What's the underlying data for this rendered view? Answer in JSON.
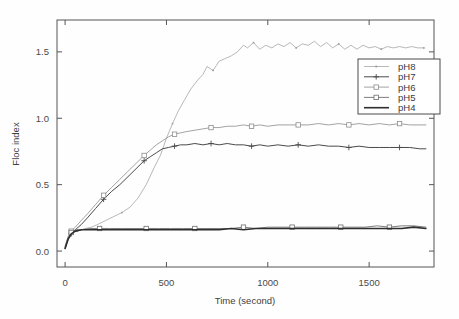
{
  "chart_data": {
    "type": "line",
    "title": "",
    "xlabel": "Time (second)",
    "ylabel": "Floc index",
    "xlim": [
      -40,
      1820
    ],
    "ylim": [
      -0.12,
      1.74
    ],
    "xticks": [
      0,
      500,
      1000,
      1500
    ],
    "xtick_labels": [
      "0",
      "500",
      "1000",
      "1500"
    ],
    "yticks": [
      0.0,
      0.5,
      1.0,
      1.5
    ],
    "ytick_labels": [
      "0.0",
      "0.5",
      "1.0",
      "1.5"
    ],
    "grid": false,
    "legend_position": "upper right",
    "series": [
      {
        "name": "pH8",
        "color": "#9a9a9a",
        "width": 0.7,
        "marker": "dot",
        "x": [
          0,
          20,
          40,
          60,
          80,
          100,
          130,
          160,
          200,
          240,
          280,
          320,
          360,
          400,
          440,
          470,
          500,
          530,
          560,
          590,
          620,
          650,
          680,
          700,
          730,
          760,
          790,
          820,
          850,
          880,
          900,
          930,
          960,
          990,
          1020,
          1050,
          1080,
          1110,
          1140,
          1170,
          1200,
          1230,
          1260,
          1290,
          1320,
          1350,
          1380,
          1410,
          1440,
          1470,
          1500,
          1530,
          1560,
          1590,
          1620,
          1650,
          1680,
          1710,
          1740,
          1770
        ],
        "y": [
          0.03,
          0.1,
          0.14,
          0.15,
          0.16,
          0.17,
          0.18,
          0.2,
          0.23,
          0.26,
          0.29,
          0.33,
          0.4,
          0.5,
          0.63,
          0.72,
          0.85,
          0.96,
          1.06,
          1.14,
          1.22,
          1.28,
          1.33,
          1.39,
          1.36,
          1.43,
          1.45,
          1.47,
          1.5,
          1.55,
          1.53,
          1.57,
          1.52,
          1.55,
          1.53,
          1.56,
          1.54,
          1.57,
          1.53,
          1.56,
          1.55,
          1.58,
          1.54,
          1.57,
          1.53,
          1.56,
          1.52,
          1.55,
          1.52,
          1.55,
          1.53,
          1.54,
          1.52,
          1.54,
          1.53,
          1.54,
          1.53,
          1.54,
          1.53,
          1.53
        ]
      },
      {
        "name": "pH7",
        "color": "#4a4a4a",
        "width": 1.0,
        "marker": "plus",
        "x": [
          0,
          15,
          30,
          50,
          80,
          110,
          150,
          190,
          230,
          270,
          310,
          350,
          390,
          420,
          450,
          480,
          510,
          540,
          570,
          600,
          640,
          680,
          720,
          760,
          800,
          840,
          880,
          920,
          960,
          1000,
          1050,
          1100,
          1150,
          1200,
          1250,
          1300,
          1350,
          1400,
          1450,
          1500,
          1550,
          1600,
          1650,
          1700,
          1750,
          1780
        ],
        "y": [
          0.02,
          0.09,
          0.13,
          0.16,
          0.2,
          0.25,
          0.32,
          0.39,
          0.45,
          0.5,
          0.56,
          0.62,
          0.68,
          0.71,
          0.74,
          0.77,
          0.78,
          0.79,
          0.8,
          0.8,
          0.81,
          0.8,
          0.81,
          0.8,
          0.81,
          0.8,
          0.8,
          0.79,
          0.8,
          0.79,
          0.8,
          0.79,
          0.8,
          0.79,
          0.8,
          0.79,
          0.79,
          0.78,
          0.79,
          0.78,
          0.78,
          0.78,
          0.78,
          0.78,
          0.77,
          0.77
        ]
      },
      {
        "name": "pH6",
        "color": "#8c8c8c",
        "width": 0.8,
        "marker": "square",
        "x": [
          0,
          15,
          30,
          50,
          80,
          110,
          150,
          190,
          230,
          270,
          310,
          350,
          390,
          420,
          450,
          480,
          510,
          540,
          570,
          600,
          640,
          680,
          720,
          760,
          800,
          840,
          880,
          920,
          960,
          1000,
          1050,
          1100,
          1150,
          1200,
          1250,
          1300,
          1350,
          1400,
          1450,
          1500,
          1550,
          1600,
          1650,
          1700,
          1750,
          1780
        ],
        "y": [
          0.04,
          0.11,
          0.15,
          0.18,
          0.23,
          0.28,
          0.35,
          0.42,
          0.48,
          0.54,
          0.6,
          0.66,
          0.72,
          0.76,
          0.8,
          0.83,
          0.86,
          0.88,
          0.89,
          0.9,
          0.91,
          0.92,
          0.93,
          0.93,
          0.94,
          0.94,
          0.95,
          0.94,
          0.95,
          0.94,
          0.95,
          0.95,
          0.95,
          0.95,
          0.96,
          0.95,
          0.96,
          0.95,
          0.96,
          0.95,
          0.96,
          0.95,
          0.96,
          0.95,
          0.95,
          0.95
        ]
      },
      {
        "name": "pH5",
        "color": "#6e6e6e",
        "width": 0.9,
        "marker": "square",
        "x": [
          0,
          15,
          30,
          50,
          80,
          120,
          170,
          220,
          280,
          340,
          400,
          460,
          520,
          580,
          640,
          700,
          760,
          820,
          880,
          940,
          1000,
          1060,
          1120,
          1180,
          1240,
          1300,
          1360,
          1420,
          1480,
          1540,
          1600,
          1660,
          1720,
          1780
        ],
        "y": [
          0.03,
          0.1,
          0.14,
          0.16,
          0.16,
          0.17,
          0.17,
          0.17,
          0.17,
          0.17,
          0.17,
          0.17,
          0.17,
          0.17,
          0.17,
          0.17,
          0.17,
          0.17,
          0.18,
          0.17,
          0.18,
          0.18,
          0.18,
          0.18,
          0.18,
          0.18,
          0.18,
          0.18,
          0.18,
          0.19,
          0.18,
          0.19,
          0.19,
          0.18
        ]
      },
      {
        "name": "pH4",
        "color": "#2e2e2e",
        "width": 1.6,
        "marker": "none",
        "x": [
          0,
          15,
          30,
          50,
          80,
          120,
          170,
          220,
          280,
          340,
          400,
          460,
          520,
          580,
          640,
          700,
          760,
          820,
          880,
          940,
          1000,
          1060,
          1120,
          1180,
          1240,
          1300,
          1360,
          1420,
          1480,
          1540,
          1600,
          1660,
          1720,
          1780
        ],
        "y": [
          0.02,
          0.09,
          0.13,
          0.15,
          0.16,
          0.16,
          0.16,
          0.16,
          0.16,
          0.16,
          0.16,
          0.16,
          0.16,
          0.16,
          0.16,
          0.16,
          0.16,
          0.17,
          0.16,
          0.17,
          0.17,
          0.17,
          0.17,
          0.17,
          0.17,
          0.17,
          0.17,
          0.17,
          0.17,
          0.17,
          0.17,
          0.17,
          0.18,
          0.17
        ]
      }
    ],
    "legend_entries": [
      "pH8",
      "pH7",
      "pH6",
      "pH5",
      "pH4"
    ]
  }
}
